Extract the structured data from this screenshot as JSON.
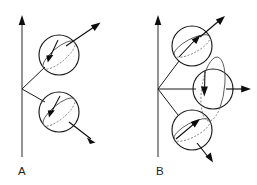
{
  "figure": {
    "background_color": "#ffffff",
    "ink_color": "#1a1a1a",
    "width": 257,
    "height": 185,
    "panels": [
      {
        "id": "A",
        "label": "A",
        "label_x": 22,
        "label_y": 175,
        "axis": {
          "name": "vertical-axis-arrow",
          "x": 22,
          "y_top": 16,
          "y_bottom": 157,
          "direction": "up",
          "head_length": 9,
          "head_width": 6
        },
        "vertex": {
          "x": 22,
          "y": 89
        },
        "spheres": [
          {
            "id": "a-sphere-top",
            "cx": 59,
            "cy": 55,
            "r": 20,
            "connector_from": {
              "x": 22,
              "y": 89
            },
            "connector_to": {
              "x": 44,
              "y": 68
            },
            "equator_tilt_deg": -40,
            "equator_rx": 20,
            "equator_ry": 7,
            "moment_vector": {
              "name": "moment-arrow",
              "from_x": 66,
              "from_y": 46,
              "to_x": 100,
              "to_y": 23,
              "head_length": 9,
              "head_width": 6
            },
            "spin_arrow": {
              "name": "spin-arrow",
              "from_x": 58,
              "from_y": 40,
              "to_x": 48,
              "to_y": 62,
              "head_length": 8,
              "head_width": 5.5
            }
          },
          {
            "id": "a-sphere-bottom",
            "cx": 59,
            "cy": 112,
            "r": 20,
            "connector_from": {
              "x": 22,
              "y": 89
            },
            "connector_to": {
              "x": 45,
              "y": 101
            },
            "equator_tilt_deg": -40,
            "equator_rx": 20,
            "equator_ry": 7,
            "moment_vector": {
              "name": "moment-arrow",
              "from_x": 69,
              "from_y": 122,
              "to_x": 95,
              "to_y": 142,
              "head_length": 9,
              "head_width": 6
            },
            "spin_arrow": {
              "name": "spin-arrow",
              "from_x": 60,
              "from_y": 96,
              "to_x": 49,
              "to_y": 117,
              "head_length": 8,
              "head_width": 5.5
            }
          }
        ]
      },
      {
        "id": "B",
        "label": "B",
        "label_x": 160,
        "label_y": 175,
        "axis": {
          "name": "vertical-axis-arrow",
          "x": 158,
          "y_top": 16,
          "y_bottom": 157,
          "direction": "up",
          "head_length": 9,
          "head_width": 6
        },
        "vertex": {
          "x": 158,
          "y": 89
        },
        "spheres": [
          {
            "id": "b-sphere-top",
            "cx": 192,
            "cy": 46,
            "r": 20,
            "connector_from": {
              "x": 158,
              "y": 89
            },
            "connector_to": {
              "x": 178,
              "y": 62
            },
            "equator_tilt_deg": -28,
            "equator_rx": 20,
            "equator_ry": 7,
            "moment_vector": {
              "name": "moment-arrow",
              "from_x": 200,
              "from_y": 37,
              "to_x": 224,
              "to_y": 17,
              "head_length": 9,
              "head_width": 6
            },
            "spin_arrow": {
              "name": "spin-arrow",
              "from_x": 182,
              "from_y": 55,
              "to_x": 200,
              "to_y": 35,
              "head_length": 8,
              "head_width": 5.5
            }
          },
          {
            "id": "b-sphere-middle",
            "cx": 213,
            "cy": 89,
            "r": 20,
            "connector_from": {
              "x": 158,
              "y": 89
            },
            "connector_to": {
              "x": 194,
              "y": 89
            },
            "equator_tilt_deg": -82,
            "equator_rx": 20,
            "equator_ry": 7,
            "moment_vector": {
              "name": "moment-arrow",
              "from_x": 226,
              "from_y": 89,
              "to_x": 250,
              "to_y": 89,
              "head_length": 9,
              "head_width": 6
            },
            "spin_arrow": {
              "name": "spin-arrow",
              "from_x": 205,
              "from_y": 72,
              "to_x": 204,
              "to_y": 96,
              "head_length": 8,
              "head_width": 5.5
            }
          },
          {
            "id": "b-sphere-bottom",
            "cx": 192,
            "cy": 130,
            "r": 20,
            "connector_from": {
              "x": 158,
              "y": 89
            },
            "connector_to": {
              "x": 177,
              "y": 114
            },
            "equator_tilt_deg": -28,
            "equator_rx": 20,
            "equator_ry": 7,
            "moment_vector": {
              "name": "moment-arrow",
              "from_x": 197,
              "from_y": 143,
              "to_x": 213,
              "to_y": 162,
              "head_length": 9,
              "head_width": 6
            },
            "spin_arrow": {
              "name": "spin-arrow",
              "from_x": 178,
              "from_y": 137,
              "to_x": 200,
              "to_y": 119,
              "head_length": 8,
              "head_width": 5.5
            }
          }
        ]
      }
    ]
  }
}
